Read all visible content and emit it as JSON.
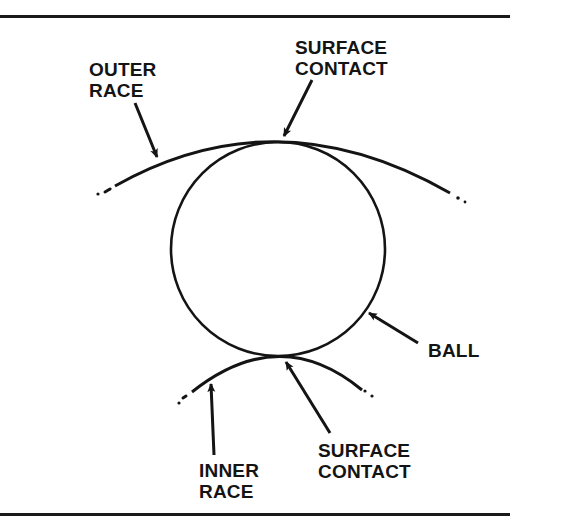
{
  "figure": {
    "labels": {
      "outer_race": {
        "line1": "OUTER",
        "line2": "RACE"
      },
      "surface_contact_top": {
        "line1": "SURFACE",
        "line2": "CONTACT"
      },
      "ball": {
        "line1": "BALL"
      },
      "surface_contact_bottom": {
        "line1": "SURFACE",
        "line2": "CONTACT"
      },
      "inner_race": {
        "line1": "INNER",
        "line2": "RACE"
      }
    },
    "colors": {
      "ink": "#141414",
      "background": "#ffffff"
    },
    "geometry": {
      "ball": {
        "cx": 278,
        "cy": 249,
        "r": 107
      },
      "outer_race_arc": "M115,186 Q278,94 450,193",
      "inner_race_arc": "M186,396 Q280,322 368,394"
    }
  }
}
